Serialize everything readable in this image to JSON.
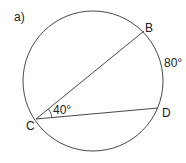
{
  "part_label": "a)",
  "points": {
    "B": "B",
    "C": "C",
    "D": "D"
  },
  "angle_label": "40°",
  "arc_label": "80°",
  "colors": {
    "stroke": "#333333",
    "text": "#222222"
  }
}
